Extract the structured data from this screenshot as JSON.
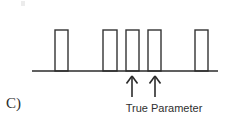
{
  "figure": {
    "panel_label": "C)",
    "annotation_label": "True Parameter",
    "colors": {
      "stroke": "#333333",
      "baseline": "#2b2b2b",
      "arrow": "#2b2b2b",
      "text": "#2f2f2f",
      "background": "#ffffff"
    }
  },
  "chart_data": {
    "type": "bar",
    "title": "",
    "subtitle": "",
    "xlabel": "",
    "ylabel": "",
    "grid": false,
    "legend": null,
    "axis": {
      "baseline_y": 71,
      "x_start": 32,
      "x_end": 218,
      "y_range": [
        0,
        1
      ],
      "x_tick_labels": [],
      "y_tick_labels": []
    },
    "bar_style": {
      "fill": "none",
      "stroke": "#333333",
      "stroke_width": 1.4
    },
    "categories": [
      "b1",
      "b2",
      "b3",
      "b4",
      "b5"
    ],
    "values": [
      1,
      1,
      1,
      1,
      1
    ],
    "bars": [
      {
        "name": "b1",
        "x": 55,
        "width": 13,
        "height": 41,
        "value": 1
      },
      {
        "name": "b2",
        "x": 103,
        "width": 14,
        "height": 41,
        "value": 1
      },
      {
        "name": "b3",
        "x": 126,
        "width": 13,
        "height": 41,
        "value": 1
      },
      {
        "name": "b4",
        "x": 148,
        "width": 13,
        "height": 41,
        "value": 1
      },
      {
        "name": "b5",
        "x": 195,
        "width": 13,
        "height": 41,
        "value": 1
      }
    ],
    "annotations": [
      {
        "type": "arrow",
        "label": "True Parameter",
        "points_to_x": 132,
        "tail_y": 97,
        "head_y": 76
      },
      {
        "type": "arrow",
        "label": "True Parameter",
        "points_to_x": 155,
        "tail_y": 97,
        "head_y": 76
      }
    ],
    "annotation_text": "True Parameter",
    "panel_label": "C)"
  }
}
